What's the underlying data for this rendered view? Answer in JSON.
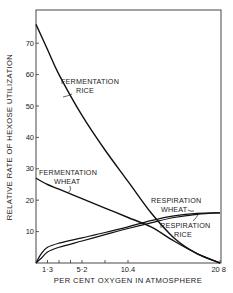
{
  "chart_data": {
    "type": "line",
    "title": "",
    "xlabel": "PER CENT OXYGEN IN ATMOSPHERE",
    "ylabel": "RELATIVE RATE OF HEXOSE UTILIZATION",
    "xlim": [
      0,
      20.8
    ],
    "ylim": [
      0,
      80
    ],
    "x_ticks": [
      1.3,
      2.6,
      3.9,
      5.2,
      7.8,
      10.4,
      20.8
    ],
    "x_tick_labels": [
      {
        "value": 1.3,
        "label": "1·3"
      },
      {
        "value": 5.2,
        "label": "5·2"
      },
      {
        "value": 10.4,
        "label": "10.4"
      },
      {
        "value": 20.8,
        "label": "20 8"
      }
    ],
    "y_ticks": [
      10,
      20,
      30,
      40,
      50,
      60,
      70
    ],
    "y_tick_labels": [
      "10",
      "20",
      "30",
      "40",
      "50",
      "60",
      "70"
    ],
    "grid": false,
    "legend": "none (curves labeled directly)",
    "series": [
      {
        "name": "Fermentation Rice",
        "label_lines": [
          "FERMENTATION",
          "RICE"
        ],
        "x": [
          0,
          1.3,
          2.6,
          5.2,
          7.8,
          10.4,
          13,
          15.6,
          18.2,
          20.8
        ],
        "values": [
          76,
          68,
          60,
          47,
          36,
          26,
          16,
          8,
          3,
          0
        ]
      },
      {
        "name": "Fermentation Wheat",
        "label_lines": [
          "FERMENTATION",
          "WHEAT"
        ],
        "x": [
          0,
          1.3,
          2.6,
          5.2,
          7.8,
          10.4,
          13,
          15.6,
          18.2,
          20.8
        ],
        "values": [
          27,
          25,
          23.5,
          20.5,
          17.5,
          14.5,
          11.5,
          7,
          3,
          0
        ]
      },
      {
        "name": "Respiration Wheat",
        "label_lines": [
          "RESPIRATION",
          "WHEAT"
        ],
        "x": [
          0,
          0.6,
          1.3,
          2.6,
          5.2,
          7.8,
          10.4,
          13,
          15.6,
          18.2,
          20.8
        ],
        "values": [
          0,
          3,
          5,
          6.3,
          8,
          9.7,
          11.5,
          13.5,
          15,
          15.8,
          16
        ]
      },
      {
        "name": "Respiration Rice",
        "label_lines": [
          "RESPIRATION",
          "RICE"
        ],
        "x": [
          0,
          0.6,
          1.3,
          2.6,
          5.2,
          7.8,
          10.4,
          13,
          15.6,
          18.2,
          20.8
        ],
        "values": [
          0,
          1.5,
          3.5,
          5,
          7,
          9,
          11,
          12.8,
          14.5,
          15.5,
          16
        ]
      }
    ]
  },
  "colors": {
    "line": "#111111",
    "background": "#ffffff"
  }
}
